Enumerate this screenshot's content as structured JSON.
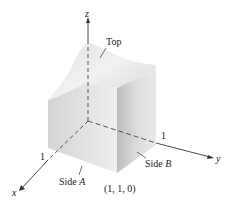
{
  "figure": {
    "axes": {
      "x_label": "x",
      "y_label": "y",
      "z_label": "z",
      "x_tick": "1",
      "y_tick": "1"
    },
    "labels": {
      "top": "Top",
      "side_a_word": "Side",
      "side_a_letter": "A",
      "side_b_word": "Side",
      "side_b_letter": "B",
      "corner_point": "(1, 1, 0)"
    },
    "colors": {
      "axis": "#333333",
      "solid_light": "#ececec",
      "solid_mid": "#d9d9d9",
      "solid_dark": "#c4c4c4"
    }
  }
}
